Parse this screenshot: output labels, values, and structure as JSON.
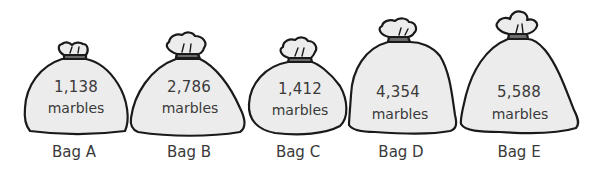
{
  "colors": {
    "bag_fill": "#ececec",
    "bag_outline": "#1a1a1a",
    "tie_band": "#6b6b6b",
    "text": "#3a3a3a"
  },
  "bags": [
    {
      "label": "Bag A",
      "count": "1,138",
      "unit": "marbles"
    },
    {
      "label": "Bag B",
      "count": "2,786",
      "unit": "marbles"
    },
    {
      "label": "Bag C",
      "count": "1,412",
      "unit": "marbles"
    },
    {
      "label": "Bag D",
      "count": "4,354",
      "unit": "marbles"
    },
    {
      "label": "Bag E",
      "count": "5,588",
      "unit": "marbles"
    }
  ]
}
